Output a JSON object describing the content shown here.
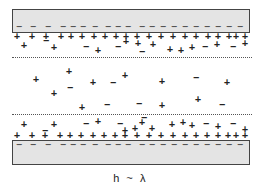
{
  "diagram": {
    "caption": "h ~ λ",
    "colors": {
      "plate_fill": "#e4e4e4",
      "plate_border": "#444444",
      "ink": "#222222"
    },
    "top_plate": {
      "label": "top-electrode",
      "surface_charge": "-",
      "charge_count": 18
    },
    "bottom_plate": {
      "label": "bottom-electrode",
      "surface_charge": "-",
      "charge_count": 18
    },
    "top_layer_boundary": "dotted",
    "bottom_layer_boundary": "dotted",
    "symbols": {
      "plus": "+",
      "minus": "−"
    }
  }
}
